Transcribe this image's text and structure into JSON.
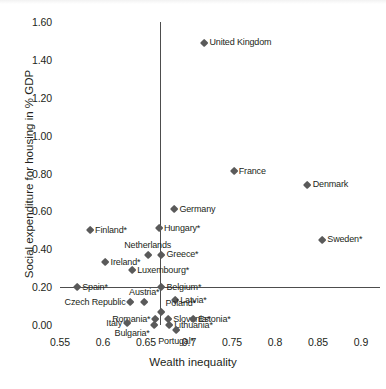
{
  "chart_data": {
    "type": "scatter",
    "title": "",
    "xlabel": "Wealth inequality",
    "ylabel": "Social expenditure for housing in % GDP",
    "xlim": [
      0.55,
      0.9
    ],
    "ylim": [
      0.0,
      1.6
    ],
    "xticks": [
      "0.55",
      "0.6",
      "0.65",
      "0.7",
      "0.75",
      "0.8",
      "0.85",
      "0.9"
    ],
    "yticks": [
      "0.00",
      "0.20",
      "0.40",
      "0.60",
      "0.80",
      "1.00",
      "1.20",
      "1.40",
      "1.60"
    ],
    "grid": false,
    "legend": "none",
    "reference_lines": [
      {
        "orientation": "vertical",
        "value": 0.667
      },
      {
        "orientation": "horizontal",
        "value": 0.2
      }
    ],
    "marker_color": "#5a5a5a",
    "axis_color": "#4d4d4d",
    "points": [
      {
        "label": "United Kingdom",
        "x": 0.718,
        "y": 1.49,
        "pos": "right"
      },
      {
        "label": "France",
        "x": 0.752,
        "y": 0.81,
        "pos": "right"
      },
      {
        "label": "Denmark",
        "x": 0.838,
        "y": 0.74,
        "pos": "right"
      },
      {
        "label": "Germany",
        "x": 0.683,
        "y": 0.61,
        "pos": "right"
      },
      {
        "label": "Finland*",
        "x": 0.585,
        "y": 0.5,
        "pos": "right"
      },
      {
        "label": "Hungary*",
        "x": 0.665,
        "y": 0.51,
        "pos": "right"
      },
      {
        "label": "Sweden*",
        "x": 0.855,
        "y": 0.45,
        "pos": "right"
      },
      {
        "label": "Netherlands",
        "x": 0.652,
        "y": 0.37,
        "pos": "above"
      },
      {
        "label": "Greece*",
        "x": 0.668,
        "y": 0.37,
        "pos": "right"
      },
      {
        "label": "Ireland*",
        "x": 0.603,
        "y": 0.33,
        "pos": "right"
      },
      {
        "label": "Luxembourg*",
        "x": 0.634,
        "y": 0.29,
        "pos": "right"
      },
      {
        "label": "Spain*",
        "x": 0.57,
        "y": 0.2,
        "pos": "right"
      },
      {
        "label": "Belgium*",
        "x": 0.668,
        "y": 0.2,
        "pos": "right"
      },
      {
        "label": "Austria*",
        "x": 0.648,
        "y": 0.12,
        "pos": "above"
      },
      {
        "label": "Latvia*",
        "x": 0.684,
        "y": 0.13,
        "pos": "right"
      },
      {
        "label": "Czech Republic",
        "x": 0.632,
        "y": 0.12,
        "pos": "left"
      },
      {
        "label": "Poland*",
        "x": 0.668,
        "y": 0.07,
        "pos": "above-right"
      },
      {
        "label": "Romania*",
        "x": 0.661,
        "y": 0.03,
        "pos": "left"
      },
      {
        "label": "Slovenia*",
        "x": 0.676,
        "y": 0.03,
        "pos": "right"
      },
      {
        "label": "Estonia*",
        "x": 0.705,
        "y": 0.03,
        "pos": "right"
      },
      {
        "label": "Italy",
        "x": 0.628,
        "y": 0.01,
        "pos": "left"
      },
      {
        "label": "Lithuania*",
        "x": 0.677,
        "y": 0.0,
        "pos": "right"
      },
      {
        "label": "Bulgaria*",
        "x": 0.659,
        "y": 0.0,
        "pos": "below-left"
      },
      {
        "label": "Portugal*",
        "x": 0.685,
        "y": -0.03,
        "pos": "below"
      }
    ]
  }
}
